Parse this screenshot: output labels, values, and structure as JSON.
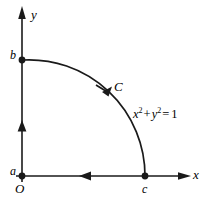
{
  "figure": {
    "kind": "line-integral-contour-diagram",
    "stroke_color": "#1a1a1a",
    "background_color": "#ffffff",
    "axes": {
      "x_label": "x",
      "y_label": "y",
      "origin_label": "O"
    },
    "points": [
      {
        "name": "a",
        "label": "a",
        "x": 22,
        "y": 176
      },
      {
        "name": "b",
        "label": "b",
        "x": 22,
        "y": 60
      },
      {
        "name": "c",
        "label": "c",
        "x": 145,
        "y": 176
      }
    ],
    "curve": {
      "label": "C",
      "equation_plain": "x^2 + y^2 = 1",
      "equation_parts": {
        "x": "x",
        "x_exp": "2",
        "plus": "+",
        "y": "y",
        "y_exp": "2",
        "equals": "=",
        "value": "1"
      },
      "radius": 116,
      "description": "quarter circle arc in first quadrant from b to c"
    },
    "direction_arrows": [
      {
        "name": "arc-direction-arrow",
        "along": "arc",
        "direction": "clockwise-from-b-to-c"
      },
      {
        "name": "x-axis-direction-arrow",
        "along": "segment-c-to-a",
        "direction": "leftward"
      },
      {
        "name": "y-axis-direction-arrow",
        "along": "segment-a-to-b",
        "direction": "upward"
      }
    ]
  }
}
